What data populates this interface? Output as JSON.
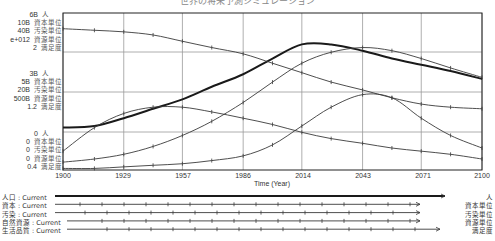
{
  "title": "世界の将来予測シミュレーション",
  "chart_data": {
    "type": "line",
    "title": "世界の将来予測シミュレーション",
    "xlabel": "Time (Year)",
    "ylabel": "",
    "xlim": [
      1900,
      2100
    ],
    "x_ticks": [
      "1900",
      "1929",
      "1957",
      "1986",
      "2014",
      "2043",
      "2071",
      "2100"
    ],
    "grid": true,
    "axis_groups": [
      {
        "position": "top",
        "rows": [
          {
            "value": "6B",
            "unit": "人"
          },
          {
            "value": "10B",
            "unit": "資本単位"
          },
          {
            "value": "40B",
            "unit": "汚染単位"
          },
          {
            "value": "e+012",
            "unit": "資源単位"
          },
          {
            "value": "2",
            "unit": "満足度"
          }
        ]
      },
      {
        "position": "middle",
        "rows": [
          {
            "value": "3B",
            "unit": "人"
          },
          {
            "value": "5B",
            "unit": "資本単位"
          },
          {
            "value": "20B",
            "unit": "汚染単位"
          },
          {
            "value": "500B",
            "unit": "資源単位"
          },
          {
            "value": "1.2",
            "unit": "満足度"
          }
        ]
      },
      {
        "position": "bottom",
        "rows": [
          {
            "value": "0",
            "unit": "人"
          },
          {
            "value": "0",
            "unit": "資本単位"
          },
          {
            "value": "0",
            "unit": "汚染単位"
          },
          {
            "value": "0",
            "unit": "資源単位"
          },
          {
            "value": "0.4",
            "unit": "満足度"
          }
        ]
      }
    ],
    "x": [
      1900,
      1915,
      1929,
      1943,
      1957,
      1971,
      1986,
      2000,
      2014,
      2028,
      2043,
      2057,
      2071,
      2085,
      2100
    ],
    "series": [
      {
        "name": "人口 : Current",
        "unit": "人",
        "style": "thick",
        "values": [
          0.27,
          0.28,
          0.33,
          0.39,
          0.45,
          0.53,
          0.61,
          0.71,
          0.8,
          0.8,
          0.76,
          0.71,
          0.67,
          0.63,
          0.58
        ]
      },
      {
        "name": "資本 : Current",
        "unit": "資本単位",
        "values": [
          0.12,
          0.27,
          0.36,
          0.4,
          0.4,
          0.37,
          0.33,
          0.29,
          0.24,
          0.2,
          0.17,
          0.14,
          0.12,
          0.1,
          0.07
        ]
      },
      {
        "name": "汚染 : Current",
        "unit": "汚染単位",
        "values": [
          0.05,
          0.07,
          0.1,
          0.15,
          0.22,
          0.31,
          0.43,
          0.56,
          0.68,
          0.75,
          0.78,
          0.76,
          0.71,
          0.65,
          0.59
        ]
      },
      {
        "name": "自然資源 : Current",
        "unit": "資源単位",
        "values": [
          0.9,
          0.89,
          0.88,
          0.86,
          0.82,
          0.78,
          0.74,
          0.68,
          0.62,
          0.56,
          0.51,
          0.46,
          0.42,
          0.4,
          0.39
        ]
      },
      {
        "name": "生活品質 : Current",
        "unit": "満足度",
        "values": [
          0.01,
          0.01,
          0.02,
          0.03,
          0.04,
          0.06,
          0.09,
          0.16,
          0.28,
          0.4,
          0.48,
          0.46,
          0.33,
          0.22,
          0.14
        ]
      }
    ],
    "legend_position": "bottom"
  },
  "legend": [
    {
      "label": "人口 : Current",
      "unit": "人"
    },
    {
      "label": "資本 : Current",
      "unit": "資本単位"
    },
    {
      "label": "汚染 : Current",
      "unit": "汚染単位"
    },
    {
      "label": "自然資源 : Current",
      "unit": "資源単位"
    },
    {
      "label": "生活品質 : Current",
      "unit": "満足度"
    }
  ],
  "colors": {
    "line": "#3a3a3a",
    "grid": "#9a9a9a",
    "frame": "#222222"
  }
}
